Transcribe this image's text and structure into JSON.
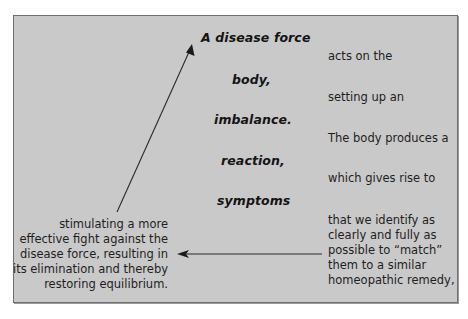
{
  "diagram": {
    "background_color": "#c9c9c9",
    "border_color": "#6e6e6e",
    "text_color": "#1e1e1e",
    "left_column_terms": [
      "A disease force",
      "body,",
      "imbalance.",
      "reaction,",
      "symptoms"
    ],
    "right_column_phrases": [
      "acts on the",
      "setting up an",
      "The body produces a",
      "which gives rise to"
    ],
    "right_final_block": [
      "that we identify as",
      "clearly and fully as",
      "possible to “match”",
      "them to a similar",
      "homeopathic remedy,"
    ],
    "left_final_block": [
      "stimulating a more",
      "effective fight against the",
      "disease force, resulting in",
      "its elimination and thereby",
      "restoring equilibrium."
    ],
    "arrows": [
      {
        "name": "return-arrow",
        "from": "right_final_block",
        "to": "left_final_block",
        "direction": "left"
      },
      {
        "name": "cycle-arrow",
        "from": "left_final_block",
        "to": "A disease force",
        "direction": "up-right"
      }
    ]
  }
}
